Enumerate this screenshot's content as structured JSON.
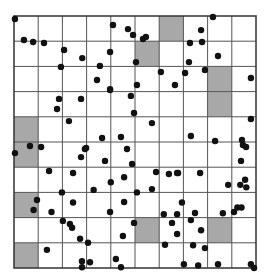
{
  "diagram": {
    "grid": {
      "columns": 10,
      "rows": 10
    },
    "colors": {
      "background": "#ffffff",
      "grid_line": "#555555",
      "border": "#333333",
      "shaded_cell": "#a8a8a8",
      "point": "#111111"
    },
    "shaded_cells": [
      {
        "col": 6,
        "row": 0
      },
      {
        "col": 5,
        "row": 1
      },
      {
        "col": 8,
        "row": 2
      },
      {
        "col": 8,
        "row": 3
      },
      {
        "col": 0,
        "row": 4
      },
      {
        "col": 0,
        "row": 5
      },
      {
        "col": 0,
        "row": 7
      },
      {
        "col": 5,
        "row": 8
      },
      {
        "col": 8,
        "row": 8
      },
      {
        "col": 0,
        "row": 9
      }
    ],
    "points": [
      [
        0.04,
        0.12
      ],
      [
        0.41,
        0.95
      ],
      [
        0.79,
        1.03
      ],
      [
        1.24,
        1.07
      ],
      [
        2.07,
        1.35
      ],
      [
        2.82,
        1.67
      ],
      [
        1.94,
        2.02
      ],
      [
        4.09,
        0.36
      ],
      [
        4.71,
        0.52
      ],
      [
        4.92,
        0.75
      ],
      [
        5.33,
        0.91
      ],
      [
        5.45,
        0.83
      ],
      [
        3.97,
        1.43
      ],
      [
        3.55,
        1.98
      ],
      [
        5.04,
        1.83
      ],
      [
        3.43,
        2.54
      ],
      [
        6.07,
        2.22
      ],
      [
        5.08,
        2.74
      ],
      [
        3.97,
        2.9
      ],
      [
        6.65,
        2.74
      ],
      [
        8.22,
        0.04
      ],
      [
        7.73,
        0.56
      ],
      [
        7.27,
        1.07
      ],
      [
        7.77,
        1.03
      ],
      [
        8.43,
        1.59
      ],
      [
        7.23,
        1.83
      ],
      [
        7.07,
        2.26
      ],
      [
        7.89,
        2.14
      ],
      [
        9.79,
        2.46
      ],
      [
        1.86,
        3.29
      ],
      [
        2.77,
        3.29
      ],
      [
        1.78,
        3.69
      ],
      [
        2.27,
        4.17
      ],
      [
        0.66,
        5.16
      ],
      [
        1.12,
        5.2
      ],
      [
        0.04,
        5.44
      ],
      [
        2.93,
        5.28
      ],
      [
        2.77,
        5.6
      ],
      [
        1.45,
        6.15
      ],
      [
        2.44,
        6.23
      ],
      [
        3.97,
        2.94
      ],
      [
        4.83,
        3.17
      ],
      [
        4.96,
        3.85
      ],
      [
        5.7,
        4.25
      ],
      [
        3.64,
        4.84
      ],
      [
        4.42,
        4.8
      ],
      [
        2.98,
        5.24
      ],
      [
        4.67,
        5.28
      ],
      [
        3.76,
        5.75
      ],
      [
        4.88,
        5.87
      ],
      [
        5.87,
        6.19
      ],
      [
        6.4,
        6.27
      ],
      [
        6.74,
        6.23
      ],
      [
        9.79,
        4.09
      ],
      [
        7.31,
        4.76
      ],
      [
        8.31,
        4.96
      ],
      [
        9.42,
        4.92
      ],
      [
        9.46,
        5.12
      ],
      [
        9.59,
        5.2
      ],
      [
        9.38,
        5.75
      ],
      [
        6.78,
        6.23
      ],
      [
        7.69,
        6.23
      ],
      [
        4.0,
        6.6
      ],
      [
        4.55,
        6.4
      ],
      [
        3.29,
        6.9
      ],
      [
        1.98,
        7.0
      ],
      [
        2.44,
        7.4
      ],
      [
        1.55,
        7.78
      ],
      [
        0.95,
        7.3
      ],
      [
        0.81,
        7.7
      ],
      [
        2.02,
        8.13
      ],
      [
        2.31,
        8.25
      ],
      [
        2.4,
        8.4
      ],
      [
        2.73,
        8.84
      ],
      [
        1.36,
        9.28
      ],
      [
        3.06,
        9.0
      ],
      [
        2.81,
        9.73
      ],
      [
        2.81,
        9.97
      ],
      [
        3.14,
        9.77
      ],
      [
        4.42,
        9.97
      ],
      [
        4.55,
        7.38
      ],
      [
        3.97,
        7.78
      ],
      [
        4.5,
        8.73
      ],
      [
        4.96,
        8.21
      ],
      [
        5.7,
        6.87
      ],
      [
        4.21,
        9.64
      ],
      [
        5.08,
        7.0
      ],
      [
        6.94,
        7.4
      ],
      [
        6.74,
        8.65
      ],
      [
        6.53,
        8.21
      ],
      [
        7.73,
        8.5
      ],
      [
        7.4,
        9.1
      ],
      [
        7.89,
        9.21
      ],
      [
        7.02,
        9.85
      ],
      [
        6.24,
        9.08
      ],
      [
        8.63,
        7.83
      ],
      [
        9.09,
        7.78
      ],
      [
        9.23,
        7.6
      ],
      [
        7.48,
        7.82
      ],
      [
        6.74,
        7.87
      ],
      [
        6.19,
        7.87
      ],
      [
        7.31,
        8.1
      ],
      [
        7.61,
        9.9
      ],
      [
        8.43,
        9.85
      ],
      [
        9.79,
        9.85
      ],
      [
        9.92,
        10.0
      ],
      [
        9.6,
        6.8
      ],
      [
        9.55,
        6.5
      ],
      [
        9.35,
        6.7
      ],
      [
        8.85,
        6.7
      ],
      [
        9.4,
        7.6
      ]
    ]
  }
}
